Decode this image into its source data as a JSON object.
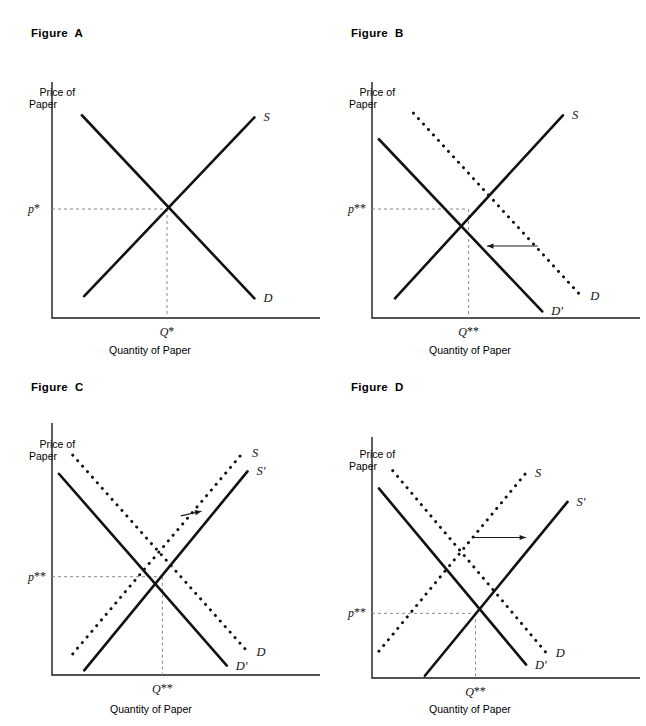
{
  "document": {
    "kind": "economics-textbook-figure-set",
    "axis_labels": {
      "y_line1": "Price of",
      "y_line2": "Paper",
      "x": "Quantity of Paper"
    }
  },
  "chart_data": [
    {
      "id": "figure-a",
      "type": "line",
      "title": "Figure  A",
      "xlabel": "Quantity of Paper",
      "ylabel": "Price of Paper",
      "grid": false,
      "legend": "inline-curve-labels",
      "price_tick": "p*",
      "quantity_tick": "Q*",
      "equilibrium": {
        "x": 0.5,
        "y": 0.5,
        "price_label": "p*",
        "quantity_label": "Q*"
      },
      "series": [
        {
          "name": "S",
          "label": "S",
          "role": "supply",
          "style": "solid",
          "points": [
            [
              0.14,
              0.1
            ],
            [
              0.88,
              0.92
            ]
          ]
        },
        {
          "name": "D",
          "label": "D",
          "role": "demand",
          "style": "solid",
          "points": [
            [
              0.13,
              0.93
            ],
            [
              0.88,
              0.09
            ]
          ]
        }
      ],
      "annotations": []
    },
    {
      "id": "figure-b",
      "type": "line",
      "title": "Figure  B",
      "xlabel": "Quantity of Paper",
      "ylabel": "Price of Paper",
      "grid": false,
      "legend": "inline-curve-labels",
      "price_tick": "p**",
      "quantity_tick": "Q**",
      "equilibrium": {
        "x": 0.42,
        "y": 0.5,
        "price_label": "p**",
        "quantity_label": "Q**"
      },
      "series": [
        {
          "name": "S",
          "label": "S",
          "role": "supply",
          "style": "solid",
          "points": [
            [
              0.1,
              0.09
            ],
            [
              0.83,
              0.93
            ]
          ]
        },
        {
          "name": "D",
          "label": "D",
          "role": "demand-original",
          "style": "dotted",
          "points": [
            [
              0.18,
              0.94
            ],
            [
              0.91,
              0.1
            ]
          ]
        },
        {
          "name": "D'",
          "label": "D'",
          "role": "demand-shifted",
          "style": "solid",
          "points": [
            [
              0.03,
              0.82
            ],
            [
              0.74,
              0.03
            ]
          ]
        }
      ],
      "annotations": [
        {
          "kind": "shift-arrow",
          "direction": "left",
          "from": [
            0.72,
            0.33
          ],
          "to": [
            0.5,
            0.33
          ]
        }
      ]
    },
    {
      "id": "figure-c",
      "type": "line",
      "title": "Figure  C",
      "xlabel": "Quantity of Paper",
      "ylabel": "Price of Paper",
      "grid": false,
      "legend": "inline-curve-labels",
      "price_tick": "p**",
      "quantity_tick": "Q**",
      "equilibrium": {
        "x": 0.48,
        "y": 0.42,
        "price_label": "p**",
        "quantity_label": "Q**"
      },
      "series": [
        {
          "name": "S",
          "label": "S",
          "role": "supply-original",
          "style": "dotted",
          "points": [
            [
              0.09,
              0.09
            ],
            [
              0.83,
              0.95
            ]
          ]
        },
        {
          "name": "S'",
          "label": "S'",
          "role": "supply-shifted",
          "style": "solid",
          "points": [
            [
              0.14,
              0.02
            ],
            [
              0.85,
              0.87
            ]
          ]
        },
        {
          "name": "D",
          "label": "D",
          "role": "demand-original",
          "style": "dotted",
          "points": [
            [
              0.09,
              0.94
            ],
            [
              0.85,
              0.1
            ]
          ]
        },
        {
          "name": "D'",
          "label": "D'",
          "role": "demand-shifted",
          "style": "solid",
          "points": [
            [
              0.03,
              0.86
            ],
            [
              0.76,
              0.04
            ]
          ]
        }
      ],
      "annotations": [
        {
          "kind": "shift-arrow",
          "direction": "right",
          "from": [
            0.56,
            0.68
          ],
          "to": [
            0.65,
            0.7
          ]
        }
      ]
    },
    {
      "id": "figure-d",
      "type": "line",
      "title": "Figure  D",
      "xlabel": "Quantity of Paper",
      "ylabel": "Price of Paper",
      "grid": false,
      "legend": "inline-curve-labels",
      "price_tick": "p**",
      "quantity_tick": "Q**",
      "equilibrium": {
        "x": 0.45,
        "y": 0.29,
        "price_label": "p**",
        "quantity_label": "Q**"
      },
      "series": [
        {
          "name": "S",
          "label": "S",
          "role": "supply-original",
          "style": "dotted",
          "points": [
            [
              0.03,
              0.12
            ],
            [
              0.67,
              0.92
            ]
          ]
        },
        {
          "name": "S'",
          "label": "S'",
          "role": "supply-shifted",
          "style": "solid",
          "points": [
            [
              0.23,
              0.01
            ],
            [
              0.85,
              0.79
            ]
          ]
        },
        {
          "name": "D",
          "label": "D",
          "role": "demand-original",
          "style": "dotted",
          "points": [
            [
              0.09,
              0.93
            ],
            [
              0.76,
              0.11
            ]
          ]
        },
        {
          "name": "D'",
          "label": "D'",
          "role": "demand-shifted",
          "style": "solid",
          "points": [
            [
              0.03,
              0.85
            ],
            [
              0.67,
              0.06
            ]
          ]
        }
      ],
      "annotations": [
        {
          "kind": "shift-arrow",
          "direction": "right",
          "from": [
            0.44,
            0.63
          ],
          "to": [
            0.67,
            0.63
          ]
        }
      ]
    }
  ]
}
